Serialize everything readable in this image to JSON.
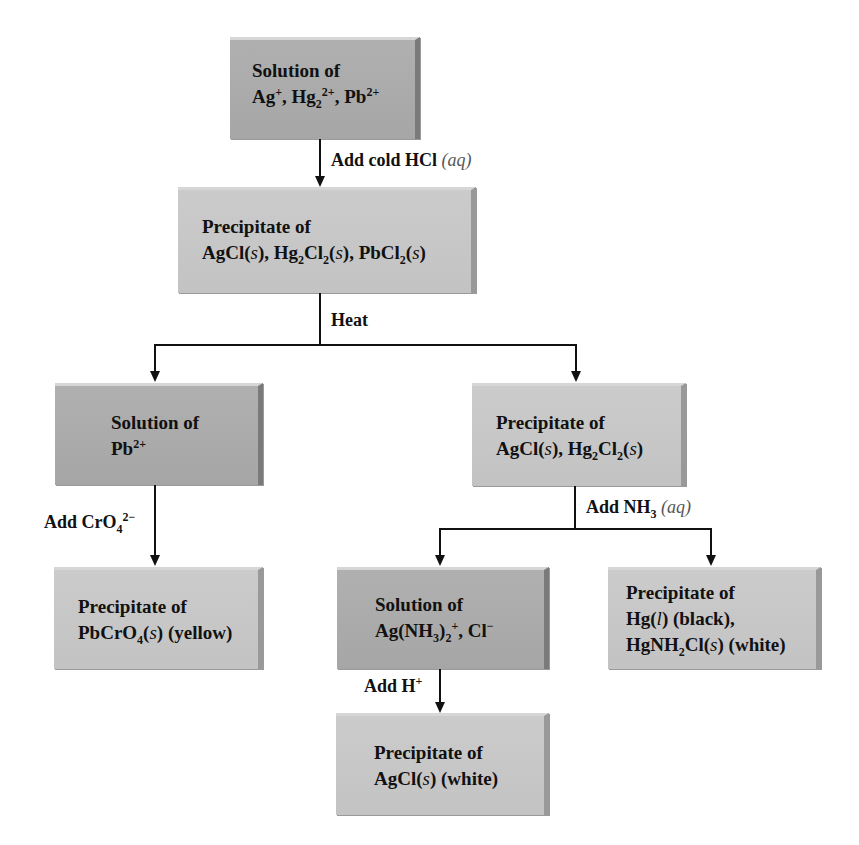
{
  "diagram": {
    "type": "flowchart",
    "nodes": [
      {
        "id": "n1",
        "kind": "solution",
        "line1": "Solution of",
        "line2_parts": [
          "Ag",
          "+",
          ", Hg",
          "2",
          "2+",
          ", Pb",
          "2+"
        ]
      },
      {
        "id": "n2",
        "kind": "precipitate",
        "line1": "Precipitate of",
        "line2_text": "AgCl(s), Hg2Cl2(s), PbCl2(s)"
      },
      {
        "id": "n3",
        "kind": "solution",
        "line1": "Solution of",
        "line2_text": "Pb2+"
      },
      {
        "id": "n4",
        "kind": "precipitate",
        "line1": "Precipitate of",
        "line2_text": "AgCl(s), Hg2Cl2(s)"
      },
      {
        "id": "n5",
        "kind": "precipitate",
        "line1": "Precipitate of",
        "line2_text": "PbCrO4(s) (yellow)"
      },
      {
        "id": "n6",
        "kind": "solution",
        "line1": "Solution of",
        "line2_text": "Ag(NH3)2+, Cl−"
      },
      {
        "id": "n7",
        "kind": "precipitate",
        "line1": "Precipitate of",
        "line2_text": "Hg(l) (black),",
        "line3_text": "HgNH2Cl(s) (white)"
      },
      {
        "id": "n8",
        "kind": "precipitate",
        "line1": "Precipitate of",
        "line2_text": "AgCl(s) (white)"
      }
    ],
    "edges": [
      {
        "from": "n1",
        "to": "n2",
        "label": "Add cold HCl (aq)"
      },
      {
        "from": "n2",
        "to": "n3",
        "label": "Heat"
      },
      {
        "from": "n2",
        "to": "n4",
        "label": "Heat"
      },
      {
        "from": "n3",
        "to": "n5",
        "label": "Add CrO4 2−"
      },
      {
        "from": "n4",
        "to": "n6",
        "label": "Add NH3 (aq)"
      },
      {
        "from": "n4",
        "to": "n7",
        "label": "Add NH3 (aq)"
      },
      {
        "from": "n6",
        "to": "n8",
        "label": "Add H+"
      }
    ],
    "labels": {
      "solution_of": "Solution of",
      "precipitate_of": "Precipitate of",
      "add_cold_hcl": "Add cold HCl",
      "aq": "(aq)",
      "heat": "Heat",
      "add_cro4": "Add CrO",
      "add_nh3": "Add NH",
      "add_h": "Add H"
    },
    "colors": {
      "solution_box": "#aaaaaa",
      "precipitate_box": "#c6c6c6",
      "line": "#111111",
      "background": "#ffffff"
    }
  }
}
